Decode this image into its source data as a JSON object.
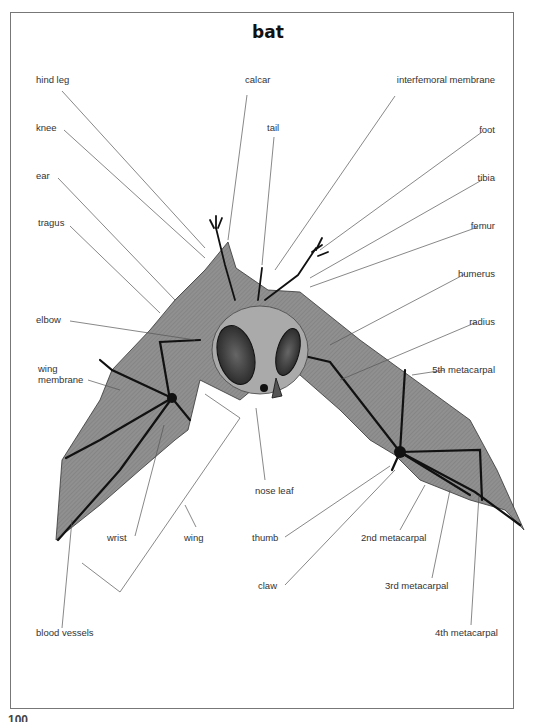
{
  "title": "bat",
  "page_number": "100",
  "colors": {
    "membrane": "#8e8e8e",
    "bone": "#1a1a1a",
    "leader": "#555555",
    "frame": "#777777",
    "text": "#333333"
  },
  "labels": {
    "left": {
      "hind_leg": "hind leg",
      "knee": "knee",
      "ear": "ear",
      "tragus": "tragus",
      "elbow": "elbow",
      "wing_membrane_1": "wing",
      "wing_membrane_2": "membrane",
      "blood_vessels": "blood vessels"
    },
    "top": {
      "calcar": "calcar",
      "tail": "tail"
    },
    "right": {
      "interfemoral_membrane": "interfemoral membrane",
      "foot": "foot",
      "tibia": "tibia",
      "femur": "femur",
      "humerus": "humerus",
      "radius": "radius",
      "fifth_metacarpal": "5th metacarpal",
      "fourth_metacarpal": "4th metacarpal",
      "third_metacarpal": "3rd metacarpal",
      "second_metacarpal": "2nd metacarpal"
    },
    "bottom": {
      "nose_leaf": "nose leaf",
      "wrist": "wrist",
      "wing": "wing",
      "thumb": "thumb",
      "claw": "claw"
    }
  }
}
